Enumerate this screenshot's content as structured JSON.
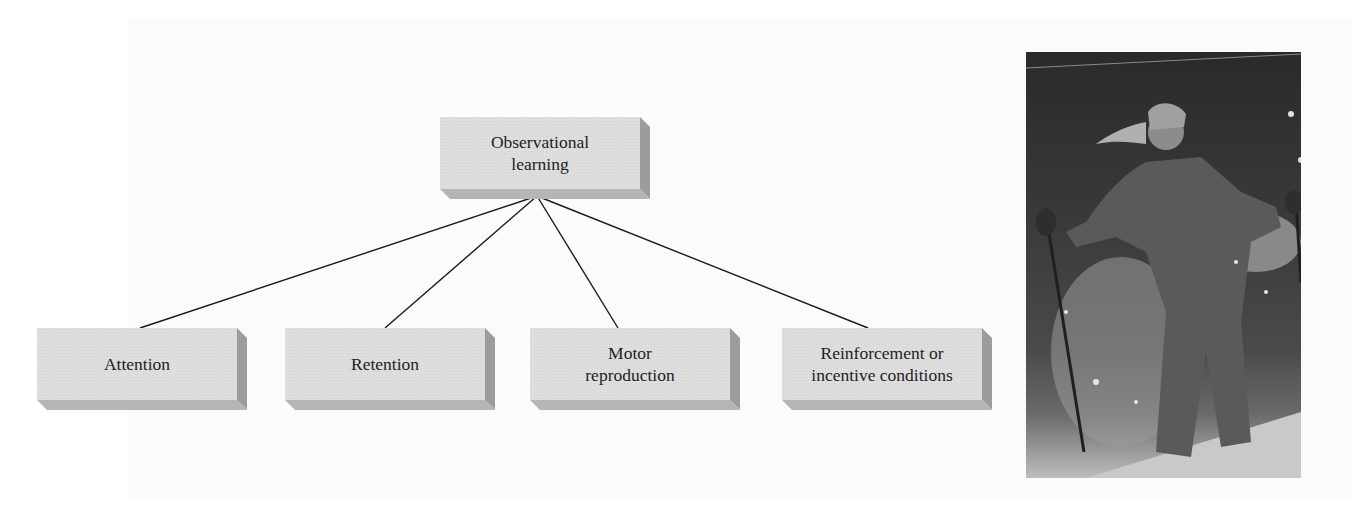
{
  "diagram": {
    "root": {
      "label": "Observational\nlearning"
    },
    "children": [
      {
        "label": "Attention"
      },
      {
        "label": "Retention"
      },
      {
        "label": "Motor\nreproduction"
      },
      {
        "label": "Reinforcement or\nincentive conditions"
      }
    ],
    "colors": {
      "box_face": "#dedede",
      "box_side": "#9c9c9c",
      "box_bottom": "#b5b5b5",
      "line": "#1a1a1a",
      "text": "#222222"
    }
  },
  "photo": {
    "description": "skier-in-powder-snow-photo",
    "alt": "Woman skiing through powder snow holding ski poles"
  }
}
